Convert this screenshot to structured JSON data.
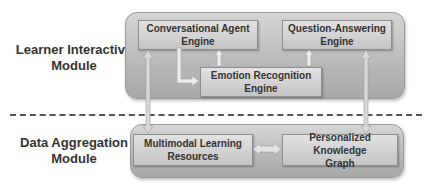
{
  "modules": {
    "top": {
      "label_line1": "Learner Interactive",
      "label_line2": "Module"
    },
    "bottom": {
      "label_line1": "Data Aggregation",
      "label_line2": "Module"
    }
  },
  "engines": {
    "conversational": {
      "line1": "Conversational Agent",
      "line2": "Engine"
    },
    "qa": {
      "line1": "Question-Answering",
      "line2": "Engine"
    },
    "emotion": {
      "line1": "Emotion Recognition",
      "line2": "Engine"
    }
  },
  "resources": {
    "multimodal": {
      "line1": "Multimodal Learning",
      "line2": "Resources"
    },
    "knowledge": {
      "line1": "Personalized Knowledge",
      "line2": "Graph"
    }
  },
  "colors": {
    "panel": "#bdbdbd",
    "box": "#d0d0d0",
    "arrow": "#e8e8e8",
    "text": "#333333"
  }
}
